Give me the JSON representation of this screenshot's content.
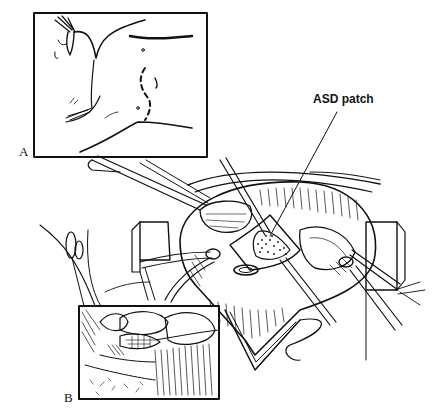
{
  "figure": {
    "panels": [
      {
        "letter": "A",
        "description": "Patient supine, incision line marked on chest"
      },
      {
        "letter": "B",
        "description": "Close-up inset of patch sutured in place"
      }
    ],
    "callouts": [
      {
        "label": "ASD patch"
      }
    ],
    "colors": {
      "ink": "#111111",
      "paper": "#ffffff",
      "shade": "#cfcfcf"
    }
  }
}
